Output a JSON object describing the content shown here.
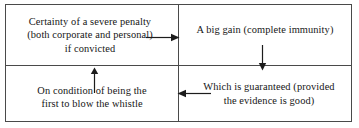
{
  "diagram": {
    "type": "cycle-flow-2x2",
    "stroke_color": "#4a4a4a",
    "text_color": "#161616",
    "background_color": "#ffffff",
    "cells": [
      {
        "id": "top-left",
        "text": "Certainty of a severe penalty\n(both corporate and personal)\nif convicted"
      },
      {
        "id": "top-right",
        "text": "A big gain (complete immunity)"
      },
      {
        "id": "bottom-left",
        "text": "On condition of being the\nfirst to blow the whistle"
      },
      {
        "id": "bottom-right",
        "text": "Which is guaranteed (provided\nthe evidence is good)"
      }
    ],
    "arrows": [
      {
        "id": "arrow-right",
        "direction": "right",
        "from": "top-left",
        "to": "top-right"
      },
      {
        "id": "arrow-down",
        "direction": "down",
        "from": "top-right",
        "to": "bottom-right"
      },
      {
        "id": "arrow-left",
        "direction": "left",
        "from": "bottom-right",
        "to": "bottom-left"
      },
      {
        "id": "arrow-up",
        "direction": "up",
        "from": "bottom-left",
        "to": "top-left"
      }
    ]
  }
}
